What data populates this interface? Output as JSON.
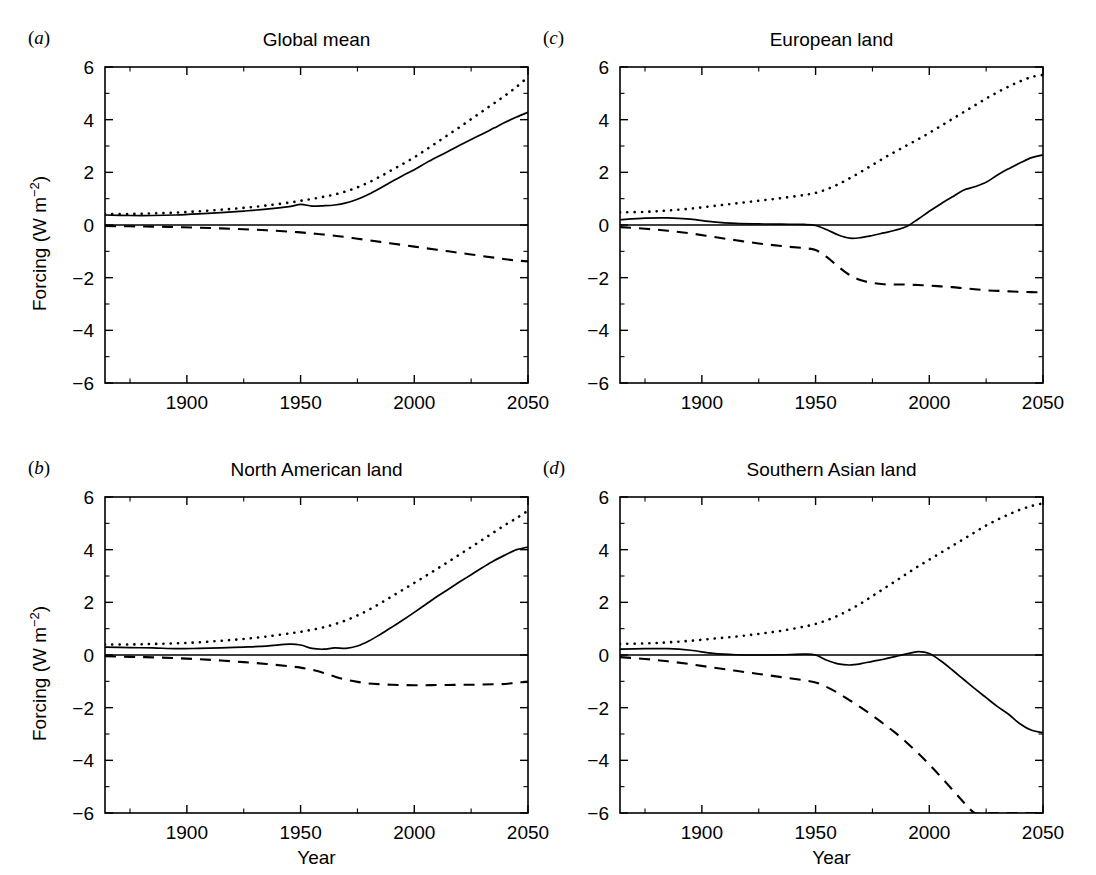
{
  "figure": {
    "width": 1096,
    "height": 875,
    "background": "#ffffff",
    "ink_color": "#000000"
  },
  "axes": {
    "xlabel": "Year",
    "ylabel_text": "Forcing (W m",
    "ylabel_sup": "−2",
    "ylabel_tail": ")",
    "ylabel_full": "Forcing (W m−2)",
    "xlim": [
      1864,
      2050
    ],
    "ylim": [
      -6,
      6
    ],
    "xticks": [
      1900,
      1950,
      2000,
      2050
    ],
    "xtick_labels": [
      "1900",
      "1950",
      "2000",
      "2050"
    ],
    "xticks_minor": [
      1875,
      1900,
      1925,
      1950,
      1975,
      2000,
      2025,
      2050
    ],
    "yticks": [
      -6,
      -4,
      -2,
      0,
      2,
      4,
      6
    ],
    "ytick_labels": [
      "−6",
      "−4",
      "−2",
      "0",
      "2",
      "4",
      "6"
    ],
    "yticks_minor": [
      -5,
      -4,
      -3,
      -2,
      -1,
      0,
      1,
      2,
      3,
      4,
      5
    ],
    "grid": false,
    "legend": "none"
  },
  "series_styles": {
    "net": "solid",
    "greenhouse": "dotted",
    "aerosol": "dashed"
  },
  "chart_data": [
    {
      "type": "line",
      "panel": "a",
      "panel_label_paren_open": "(",
      "panel_label_letter": "a",
      "panel_label_paren_close": ")",
      "title": "Global mean",
      "xlabel": "",
      "ylabel": "Forcing (W m−2)",
      "xlim": [
        1864,
        2050
      ],
      "ylim": [
        -6,
        6
      ],
      "x": [
        1864,
        1875,
        1885,
        1895,
        1905,
        1915,
        1925,
        1935,
        1945,
        1950,
        1955,
        1960,
        1965,
        1970,
        1975,
        1980,
        1985,
        1990,
        1995,
        2000,
        2005,
        2010,
        2015,
        2020,
        2025,
        2030,
        2035,
        2040,
        2045,
        2050
      ],
      "series": [
        {
          "name": "net forcing",
          "style": "solid",
          "values": [
            0.38,
            0.36,
            0.36,
            0.38,
            0.42,
            0.47,
            0.53,
            0.6,
            0.7,
            0.78,
            0.72,
            0.73,
            0.76,
            0.84,
            0.98,
            1.17,
            1.4,
            1.64,
            1.88,
            2.1,
            2.35,
            2.58,
            2.8,
            3.03,
            3.25,
            3.46,
            3.68,
            3.9,
            4.1,
            4.28
          ]
        },
        {
          "name": "greenhouse gases",
          "style": "dotted",
          "values": [
            0.42,
            0.42,
            0.44,
            0.47,
            0.52,
            0.58,
            0.65,
            0.74,
            0.85,
            0.92,
            0.99,
            1.07,
            1.16,
            1.28,
            1.43,
            1.62,
            1.84,
            2.08,
            2.32,
            2.57,
            2.85,
            3.14,
            3.43,
            3.72,
            4.02,
            4.32,
            4.62,
            4.92,
            5.25,
            5.62
          ]
        },
        {
          "name": "aerosols",
          "style": "dashed",
          "values": [
            -0.04,
            -0.05,
            -0.06,
            -0.08,
            -0.1,
            -0.13,
            -0.16,
            -0.2,
            -0.25,
            -0.28,
            -0.32,
            -0.36,
            -0.41,
            -0.46,
            -0.52,
            -0.58,
            -0.64,
            -0.7,
            -0.76,
            -0.82,
            -0.88,
            -0.94,
            -1.0,
            -1.06,
            -1.12,
            -1.18,
            -1.24,
            -1.3,
            -1.35,
            -1.38
          ]
        }
      ]
    },
    {
      "type": "line",
      "panel": "b",
      "panel_label_paren_open": "(",
      "panel_label_letter": "b",
      "panel_label_paren_close": ")",
      "title": "North American land",
      "xlabel": "Year",
      "ylabel": "Forcing (W m−2)",
      "xlim": [
        1864,
        2050
      ],
      "ylim": [
        -6,
        6
      ],
      "x": [
        1864,
        1875,
        1885,
        1895,
        1905,
        1915,
        1925,
        1935,
        1945,
        1950,
        1955,
        1960,
        1965,
        1970,
        1975,
        1980,
        1985,
        1990,
        1995,
        2000,
        2005,
        2010,
        2015,
        2020,
        2025,
        2030,
        2035,
        2040,
        2045,
        2050
      ],
      "series": [
        {
          "name": "net forcing",
          "style": "solid",
          "values": [
            0.3,
            0.28,
            0.27,
            0.24,
            0.25,
            0.27,
            0.3,
            0.34,
            0.41,
            0.38,
            0.25,
            0.22,
            0.27,
            0.25,
            0.34,
            0.53,
            0.78,
            1.05,
            1.33,
            1.62,
            1.92,
            2.22,
            2.5,
            2.78,
            3.05,
            3.32,
            3.58,
            3.8,
            4.0,
            4.1
          ]
        },
        {
          "name": "greenhouse gases",
          "style": "dotted",
          "values": [
            0.4,
            0.4,
            0.42,
            0.44,
            0.48,
            0.54,
            0.61,
            0.7,
            0.82,
            0.88,
            0.96,
            1.05,
            1.17,
            1.32,
            1.5,
            1.72,
            1.96,
            2.22,
            2.48,
            2.74,
            3.0,
            3.27,
            3.54,
            3.82,
            4.1,
            4.38,
            4.66,
            4.94,
            5.2,
            5.48
          ]
        },
        {
          "name": "aerosols",
          "style": "dashed",
          "values": [
            -0.05,
            -0.07,
            -0.09,
            -0.12,
            -0.16,
            -0.21,
            -0.27,
            -0.34,
            -0.43,
            -0.48,
            -0.56,
            -0.68,
            -0.82,
            -0.94,
            -1.02,
            -1.08,
            -1.11,
            -1.13,
            -1.14,
            -1.15,
            -1.15,
            -1.14,
            -1.14,
            -1.13,
            -1.13,
            -1.12,
            -1.11,
            -1.1,
            -1.05,
            -1.02
          ]
        }
      ]
    },
    {
      "type": "line",
      "panel": "c",
      "panel_label_paren_open": "(",
      "panel_label_letter": "c",
      "panel_label_paren_close": ")",
      "title": "European land",
      "xlabel": "",
      "ylabel": "",
      "xlim": [
        1864,
        2050
      ],
      "ylim": [
        -6,
        6
      ],
      "x": [
        1864,
        1875,
        1885,
        1895,
        1905,
        1915,
        1925,
        1935,
        1945,
        1950,
        1955,
        1960,
        1965,
        1970,
        1975,
        1980,
        1985,
        1990,
        1995,
        2000,
        2005,
        2010,
        2015,
        2020,
        2025,
        2030,
        2035,
        2040,
        2045,
        2050
      ],
      "series": [
        {
          "name": "net forcing",
          "style": "solid",
          "values": [
            0.2,
            0.26,
            0.27,
            0.22,
            0.12,
            0.06,
            0.04,
            0.03,
            0.02,
            -0.02,
            -0.18,
            -0.38,
            -0.5,
            -0.48,
            -0.4,
            -0.3,
            -0.2,
            -0.06,
            0.22,
            0.52,
            0.8,
            1.06,
            1.32,
            1.45,
            1.62,
            1.9,
            2.14,
            2.36,
            2.56,
            2.66
          ]
        },
        {
          "name": "greenhouse gases",
          "style": "dotted",
          "values": [
            0.48,
            0.5,
            0.55,
            0.62,
            0.72,
            0.82,
            0.92,
            1.02,
            1.14,
            1.22,
            1.36,
            1.55,
            1.78,
            2.02,
            2.28,
            2.54,
            2.78,
            3.02,
            3.25,
            3.5,
            3.76,
            4.02,
            4.28,
            4.54,
            4.8,
            5.04,
            5.26,
            5.46,
            5.62,
            5.7
          ]
        },
        {
          "name": "aerosols",
          "style": "dashed",
          "values": [
            -0.08,
            -0.14,
            -0.22,
            -0.32,
            -0.45,
            -0.58,
            -0.7,
            -0.8,
            -0.88,
            -0.95,
            -1.22,
            -1.58,
            -1.9,
            -2.1,
            -2.2,
            -2.25,
            -2.26,
            -2.26,
            -2.28,
            -2.3,
            -2.33,
            -2.36,
            -2.4,
            -2.44,
            -2.48,
            -2.5,
            -2.52,
            -2.54,
            -2.55,
            -2.56
          ]
        }
      ]
    },
    {
      "type": "line",
      "panel": "d",
      "panel_label_paren_open": "(",
      "panel_label_letter": "d",
      "panel_label_paren_close": ")",
      "title": "Southern Asian land",
      "xlabel": "Year",
      "ylabel": "",
      "xlim": [
        1864,
        2050
      ],
      "ylim": [
        -6,
        6
      ],
      "x": [
        1864,
        1875,
        1885,
        1895,
        1905,
        1915,
        1925,
        1935,
        1945,
        1950,
        1955,
        1960,
        1965,
        1970,
        1975,
        1980,
        1985,
        1990,
        1995,
        2000,
        2005,
        2010,
        2015,
        2020,
        2025,
        2030,
        2035,
        2040,
        2045,
        2050
      ],
      "series": [
        {
          "name": "net forcing",
          "style": "solid",
          "values": [
            0.22,
            0.24,
            0.24,
            0.18,
            0.06,
            0.01,
            0.0,
            0.01,
            0.03,
            0.0,
            -0.2,
            -0.34,
            -0.38,
            -0.33,
            -0.24,
            -0.16,
            -0.06,
            0.04,
            0.13,
            0.06,
            -0.22,
            -0.56,
            -0.92,
            -1.28,
            -1.62,
            -1.96,
            -2.26,
            -2.62,
            -2.86,
            -2.95
          ]
        },
        {
          "name": "greenhouse gases",
          "style": "dotted",
          "values": [
            0.42,
            0.44,
            0.48,
            0.54,
            0.62,
            0.7,
            0.8,
            0.92,
            1.08,
            1.18,
            1.32,
            1.5,
            1.72,
            1.96,
            2.24,
            2.52,
            2.8,
            3.08,
            3.36,
            3.62,
            3.88,
            4.14,
            4.4,
            4.66,
            4.92,
            5.14,
            5.34,
            5.52,
            5.66,
            5.76
          ]
        },
        {
          "name": "aerosols",
          "style": "dashed",
          "values": [
            -0.08,
            -0.15,
            -0.24,
            -0.35,
            -0.48,
            -0.6,
            -0.72,
            -0.84,
            -0.96,
            -1.04,
            -1.22,
            -1.45,
            -1.72,
            -2.0,
            -2.3,
            -2.62,
            -2.95,
            -3.32,
            -3.72,
            -4.16,
            -4.62,
            -5.1,
            -5.58,
            -6.0,
            -6.0,
            -6.0,
            -6.0,
            -6.0,
            -6.0,
            -6.0
          ]
        }
      ]
    }
  ]
}
